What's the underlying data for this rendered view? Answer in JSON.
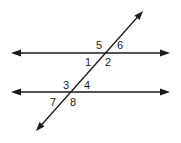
{
  "diagram": {
    "colors": {
      "line": "#1a1a1a",
      "background": "#ffffff"
    },
    "lines": {
      "parallel_top": {
        "x1": 11,
        "y1": 53,
        "x2": 170,
        "y2": 53
      },
      "parallel_bottom": {
        "x1": 11,
        "y1": 92,
        "x2": 170,
        "y2": 92
      },
      "transversal": {
        "x1": 36,
        "y1": 131,
        "x2": 143,
        "y2": 11
      }
    },
    "angle_labels": [
      {
        "id": "5",
        "text": "5",
        "x": 96,
        "y": 49
      },
      {
        "id": "6",
        "text": "6",
        "x": 117,
        "y": 49
      },
      {
        "id": "1",
        "text": "1",
        "x": 85,
        "y": 66
      },
      {
        "id": "2",
        "text": "2",
        "x": 105,
        "y": 66
      },
      {
        "id": "3",
        "text": "3",
        "x": 63,
        "y": 89
      },
      {
        "id": "4",
        "text": "4",
        "x": 84,
        "y": 89
      },
      {
        "id": "7",
        "text": "7",
        "x": 50,
        "y": 106
      },
      {
        "id": "8",
        "text": "8",
        "x": 70,
        "y": 106
      }
    ]
  }
}
